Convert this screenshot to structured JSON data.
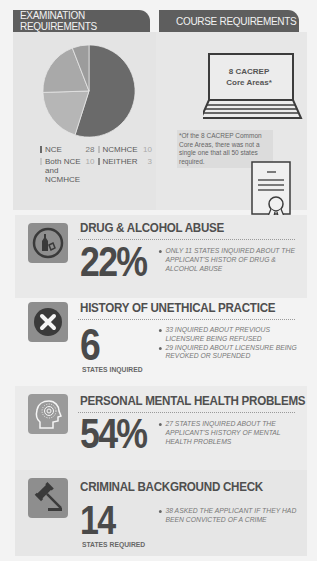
{
  "tabs": {
    "exam": "EXAMINATION REQUIREMENTS",
    "course": "COURSE REQUIREMENTS"
  },
  "chart_data": {
    "type": "pie",
    "title": "Examination Requirements",
    "categories": [
      "NCE",
      "NCMHCE",
      "Both NCE and NCMHCE",
      "NEITHER"
    ],
    "values": [
      28,
      10,
      10,
      3
    ],
    "colors": [
      "#6a6a6a",
      "#a9a9a9",
      "#b6b6b6",
      "#9c9c9c"
    ],
    "legend_position": "bottom"
  },
  "legend": {
    "items": [
      {
        "label": "NCE",
        "value": "28"
      },
      {
        "label": "NCMHCE",
        "value": "10"
      },
      {
        "label": "Both NCE and NCMHCE",
        "value": "10"
      },
      {
        "label": "NEITHER",
        "value": "3"
      }
    ]
  },
  "course": {
    "laptop_line1": "8 CACREP",
    "laptop_line2": "Core Areas*",
    "footnote": "*Of the 8 CACREP Common Core Areas, there was not a single one that all 50 states required."
  },
  "sections": [
    {
      "icon": "bottle-icon",
      "title": "DRUG & ALCOHOL ABUSE",
      "big": "22%",
      "sub": "",
      "bullets": [
        "ONLY 11 STATES INQUIRED ABOUT THE APPLICANT'S HISTOR OF DRUG & ALCOHOL ABUSE"
      ]
    },
    {
      "icon": "x-circle-icon",
      "title": "HISTORY OF UNETHICAL PRACTICE",
      "big": "6",
      "sub": "STATES INQUIRED",
      "bullets": [
        "33 INQUIRED ABOUT PREVIOUS LICENSURE BEING REFUSED",
        "29 INQUIRED ABOUT LICENSURE BEING REVOKED OR SUPENDED"
      ]
    },
    {
      "icon": "head-brain-icon",
      "title": "PERSONAL MENTAL HEALTH PROBLEMS",
      "big": "54%",
      "sub": "",
      "bullets": [
        "27 STATES INQUIRED ABOUT THE APPLICANT'S HISTORY OF MENTAL HEALTH PROBLEMS"
      ]
    },
    {
      "icon": "gavel-icon",
      "title": "CRIMINAL BACKGROUND CHECK",
      "big": "14",
      "sub": "STATES REQUIRED",
      "bullets": [
        "38 ASKED THE APPLICANT IF THEY HAD BEEN CONVICTED OF A CRIME"
      ]
    }
  ]
}
